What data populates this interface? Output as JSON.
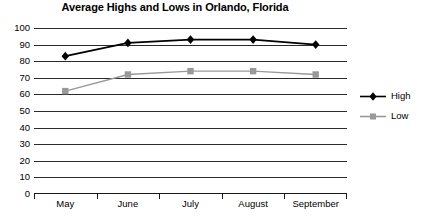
{
  "chart_data": {
    "type": "line",
    "title": "Average Highs and Lows in Orlando, Florida",
    "xlabel": "",
    "ylabel": "",
    "categories": [
      "May",
      "June",
      "July",
      "August",
      "September"
    ],
    "series": [
      {
        "name": "High",
        "values": [
          83,
          91,
          93,
          93,
          90
        ],
        "color": "#000000",
        "marker": "diamond"
      },
      {
        "name": "Low",
        "values": [
          62,
          72,
          74,
          74,
          72
        ],
        "color": "#999999",
        "marker": "square"
      }
    ],
    "ylim": [
      0,
      100
    ],
    "yticks": [
      0,
      10,
      20,
      30,
      40,
      50,
      60,
      70,
      80,
      90,
      100
    ],
    "ytick_labels": [
      "0",
      "10",
      "20",
      "30",
      "40",
      "50",
      "60",
      "70",
      "80",
      "90",
      "100"
    ],
    "grid": true,
    "legend_position": "right"
  },
  "legend": {
    "entries": [
      {
        "label": "High"
      },
      {
        "label": "Low"
      }
    ]
  },
  "colors": {
    "high_series": "#000000",
    "low_series": "#999999",
    "gridline": "#2b2b2b",
    "background": "#ffffff",
    "text": "#000000"
  }
}
